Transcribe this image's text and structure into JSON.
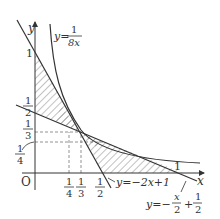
{
  "diagram": {
    "type": "function-graph",
    "axes": {
      "x_label": "x",
      "y_label": "y",
      "origin_label": "O"
    },
    "curves": [
      {
        "name": "hyperbola",
        "equation_lhs": "y=",
        "num": "1",
        "den": "8x"
      },
      {
        "name": "line1",
        "equation": "y=−2x+1"
      },
      {
        "name": "line2",
        "equation_lhs": "y=−",
        "frac1_num": "x",
        "frac1_den": "2",
        "plus": "+",
        "frac2_num": "1",
        "frac2_den": "2"
      }
    ],
    "x_ticks": [
      {
        "num": "1",
        "den": "4"
      },
      {
        "num": "1",
        "den": "3"
      },
      {
        "num": "1",
        "den": "2"
      },
      {
        "plain": "1"
      }
    ],
    "y_ticks": [
      {
        "plain": "1"
      },
      {
        "num": "1",
        "den": "2"
      },
      {
        "num": "1",
        "den": "3"
      },
      {
        "num": "1",
        "den": "4"
      }
    ],
    "colors": {
      "line": "#333333",
      "hatch": "#555555",
      "dash": "#777777"
    }
  }
}
